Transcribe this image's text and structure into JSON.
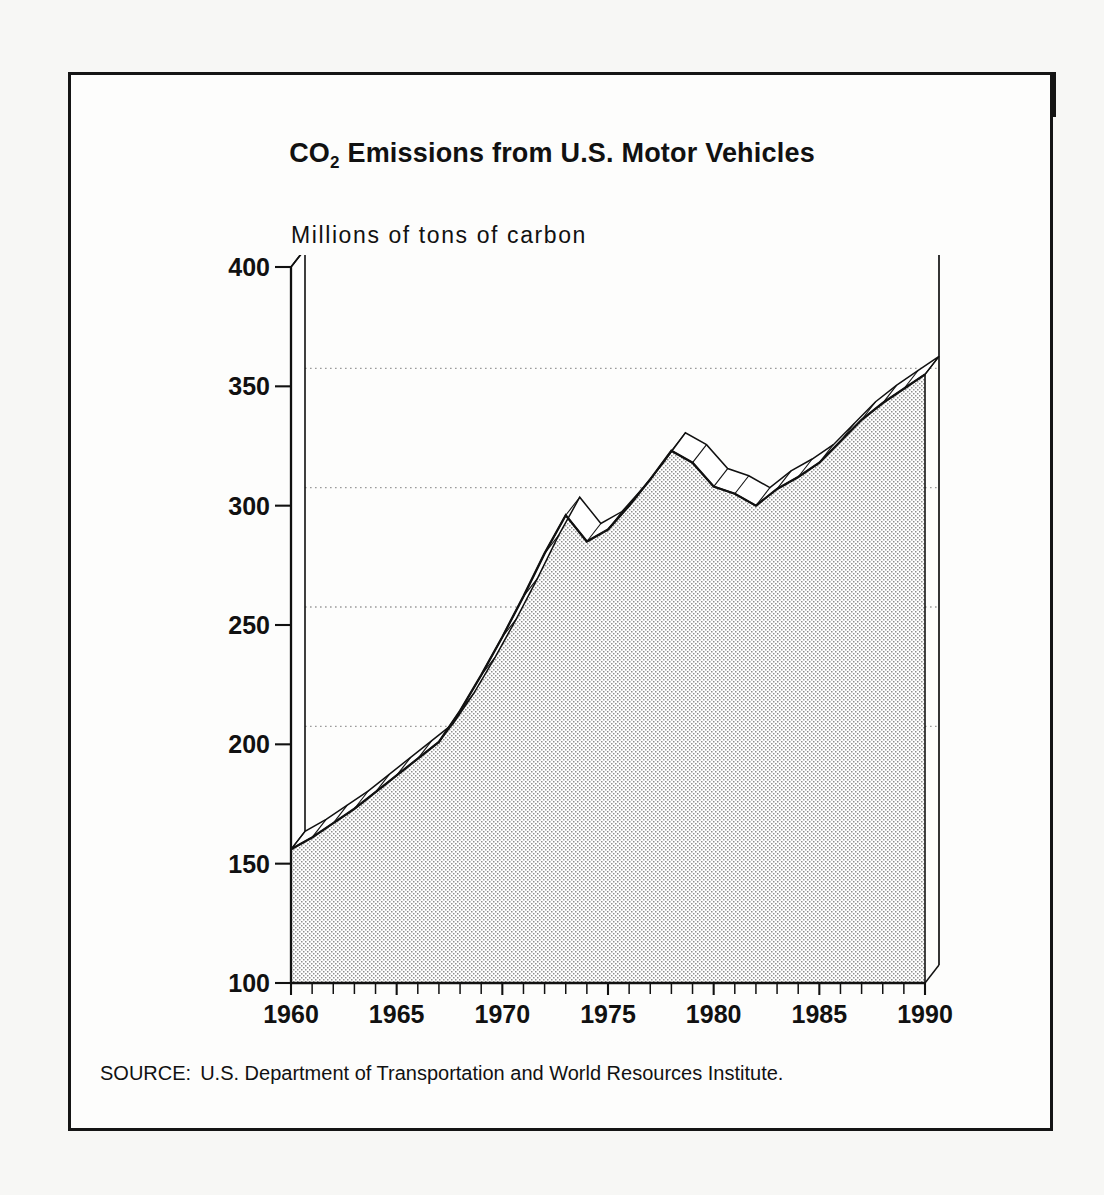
{
  "figure": {
    "label": "Figure 14",
    "title_main": "CO",
    "title_sub": "2",
    "title_rest": " Emissions from U.S. Motor Vehicles",
    "title_full": "CO2 Emissions from U.S. Motor Vehicles"
  },
  "source": {
    "label": "SOURCE:",
    "text": "U.S. Department of Transportation and World Resources Institute."
  },
  "colors": {
    "page_background": "#f7f7f5",
    "figure_background": "#fdfdfc",
    "header_bar": "#141414",
    "header_text": "#ffffff",
    "border": "#151515",
    "ink": "#111111",
    "area_fill_pattern": "#8a8a8a",
    "area_fill_base": "#ffffff",
    "gridline": "#9a9a9a"
  },
  "chart_data": {
    "type": "area",
    "title": "CO2 Emissions from U.S. Motor Vehicles",
    "subtitle": "",
    "xlabel": "",
    "ylabel": "Millions of tons of carbon",
    "xlim": [
      1960,
      1990
    ],
    "ylim": [
      100,
      400
    ],
    "grid": true,
    "gridlines_y": [
      200,
      250,
      300,
      350
    ],
    "legend": "none",
    "style_3d": true,
    "ytick_labels": [
      "100",
      "150",
      "200",
      "250",
      "300",
      "350",
      "400"
    ],
    "yticks": [
      100,
      150,
      200,
      250,
      300,
      350,
      400
    ],
    "xtick_labels": [
      "1960",
      "1965",
      "1970",
      "1975",
      "1980",
      "1985",
      "1990"
    ],
    "xticks": [
      1960,
      1965,
      1970,
      1975,
      1980,
      1985,
      1990
    ],
    "x_minor_tick_interval": 1,
    "series": [
      {
        "name": "CO2 emissions from U.S. motor vehicles",
        "unit": "millions of tons of carbon",
        "x": [
          1960,
          1961,
          1962,
          1963,
          1964,
          1965,
          1966,
          1967,
          1968,
          1969,
          1970,
          1971,
          1972,
          1973,
          1974,
          1975,
          1976,
          1977,
          1978,
          1979,
          1980,
          1981,
          1982,
          1983,
          1984,
          1985,
          1986,
          1987,
          1988,
          1989,
          1990
        ],
        "values": [
          156,
          161,
          167,
          173,
          180,
          187,
          194,
          201,
          214,
          229,
          245,
          262,
          280,
          296,
          285,
          290,
          300,
          311,
          323,
          318,
          308,
          305,
          300,
          307,
          312,
          318,
          327,
          336,
          343,
          349,
          355
        ]
      }
    ],
    "annotations": [
      {
        "text": "1973 peak then 1974 dip",
        "x": 1974,
        "y": 285
      },
      {
        "text": "1978 peak then decline to 1982",
        "x": 1978,
        "y": 323
      }
    ]
  }
}
